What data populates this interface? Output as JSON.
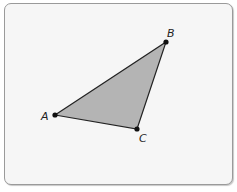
{
  "diagram": {
    "type": "triangle",
    "fill_color": "#b4b4b4",
    "stroke_color": "#222222",
    "points": [
      {
        "label": "A",
        "x": 55,
        "y": 115,
        "label_x": 41,
        "label_y": 120
      },
      {
        "label": "B",
        "x": 166,
        "y": 42,
        "label_x": 167,
        "label_y": 37
      },
      {
        "label": "C",
        "x": 137,
        "y": 129,
        "label_x": 139,
        "label_y": 142
      }
    ]
  }
}
